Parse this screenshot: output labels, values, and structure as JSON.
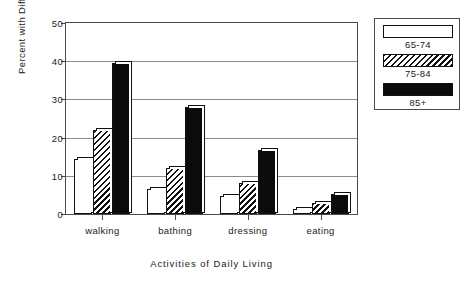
{
  "chart_data": {
    "type": "bar",
    "title": "",
    "xlabel": "Activities of Daily Living",
    "ylabel": "Percent with Difficulty",
    "categories": [
      "walking",
      "bathing",
      "dressing",
      "eating"
    ],
    "series": [
      {
        "name": "65-74",
        "fill": "open",
        "values": [
          14.5,
          6.5,
          4.8,
          1.2
        ]
      },
      {
        "name": "75-84",
        "fill": "hatch",
        "values": [
          22.0,
          12.0,
          8.0,
          3.0
        ]
      },
      {
        "name": "85+",
        "fill": "solid",
        "values": [
          39.5,
          28.0,
          16.8,
          5.2
        ]
      }
    ],
    "ylim": [
      0,
      50
    ],
    "yticks": [
      0,
      10,
      20,
      30,
      40,
      50
    ],
    "ytick_labels": [
      "0",
      "10",
      "20",
      "30",
      "40",
      "50"
    ],
    "grid": "horizontal",
    "legend_position": "right-outside",
    "colors": {
      "axis": "#4a4a4a",
      "grid": "#8c8c8c",
      "bar_edge": "#111111",
      "solid_fill": "#0b0b0b",
      "open_fill": "#ffffff",
      "background": "#ffffff",
      "text": "#1a1a1a"
    }
  },
  "legend": {
    "entries": [
      {
        "label": "65-74"
      },
      {
        "label": "75-84"
      },
      {
        "label": "85+"
      }
    ]
  }
}
